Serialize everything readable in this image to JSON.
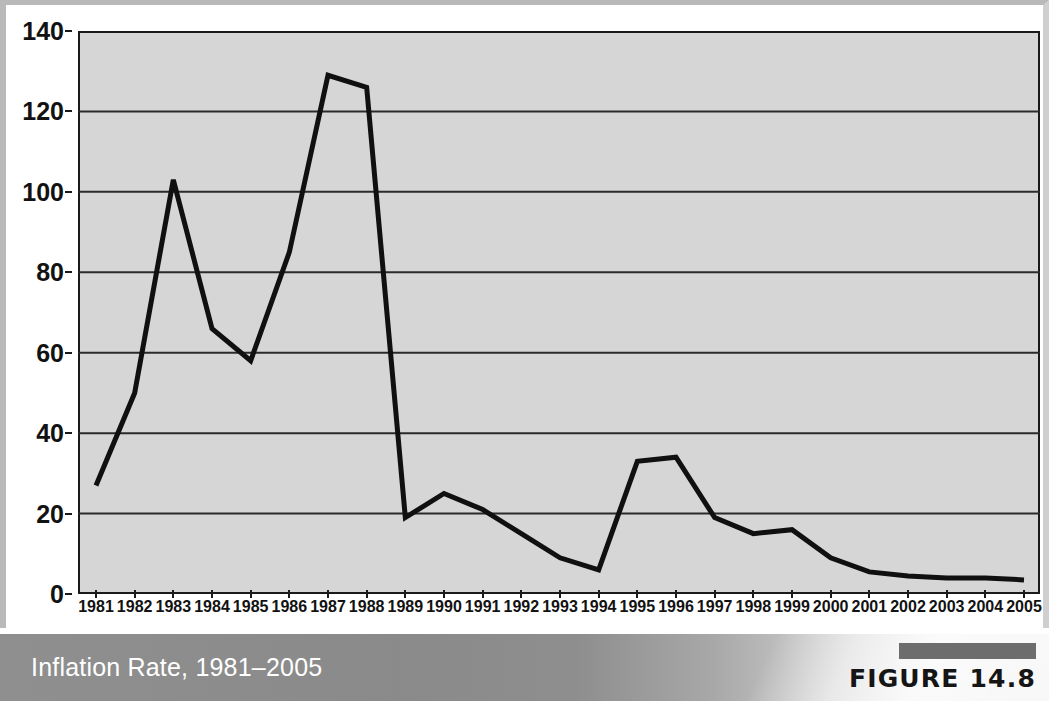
{
  "caption": {
    "title": "Inflation Rate, 1981–2005",
    "figure_label": "FIGURE 14.8"
  },
  "chart_data": {
    "type": "line",
    "title": "Inflation Rate, 1981–2005",
    "xlabel": "",
    "ylabel": "",
    "ylim": [
      0,
      140
    ],
    "ytick_interval": 20,
    "grid": true,
    "legend": "none",
    "line_color": "#101010",
    "plot_background": "#d6d6d6",
    "yticks": [
      0,
      20,
      40,
      60,
      80,
      100,
      120,
      140
    ],
    "ytick_labels": [
      "0",
      "20",
      "40",
      "60",
      "80",
      "100",
      "120",
      "140"
    ],
    "categories": [
      "1981",
      "1982",
      "1983",
      "1984",
      "1985",
      "1986",
      "1987",
      "1988",
      "1989",
      "1990",
      "1991",
      "1992",
      "1993",
      "1994",
      "1995",
      "1996",
      "1997",
      "1998",
      "1999",
      "2000",
      "2001",
      "2002",
      "2003",
      "2004",
      "2005"
    ],
    "values": [
      27,
      50,
      103,
      66,
      58,
      85,
      129,
      126,
      19,
      25,
      21,
      15,
      9,
      6,
      33,
      34,
      19,
      15,
      16,
      9,
      5.5,
      4.5,
      4,
      4,
      3.5
    ]
  }
}
